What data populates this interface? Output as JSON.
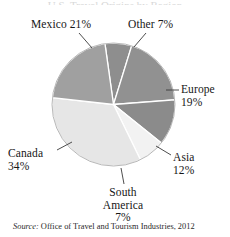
{
  "figure": {
    "title_remnant": "U.S. Travel Origins by Region",
    "source_prefix": "Source:",
    "source_text": " Office of Travel and Tourism Industries, 2012"
  },
  "labels": {
    "mexico": {
      "name": "Mexico",
      "pct": "21%"
    },
    "other": {
      "name": "Other",
      "pct": "7%"
    },
    "europe": {
      "name": "Europe",
      "pct": "19%"
    },
    "asia": {
      "name": "Asia",
      "pct": "12%"
    },
    "canada": {
      "name": "Canada",
      "pct": "34%"
    },
    "south_america": {
      "name": "South",
      "name2": "America",
      "pct": "7%"
    }
  },
  "chart_data": {
    "type": "pie",
    "title": "",
    "categories": [
      "Other",
      "Europe",
      "Asia",
      "South America",
      "Canada",
      "Mexico"
    ],
    "values": [
      7,
      19,
      12,
      7,
      34,
      21
    ],
    "units": "percent",
    "total": 100,
    "start_angle_deg": -8,
    "direction": "clockwise",
    "legend": "none",
    "labels_position": "external-with-leader-lines",
    "colors": [
      "#8e8e8e",
      "#919191",
      "#8b8b8b",
      "#f2f2f2",
      "#e6e6e6",
      "#a0a0a0"
    ],
    "separator_color": "#ffffff",
    "slices": [
      {
        "label": "Other",
        "value": 7,
        "color": "#8e8e8e"
      },
      {
        "label": "Europe",
        "value": 19,
        "color": "#919191"
      },
      {
        "label": "Asia",
        "value": 12,
        "color": "#8b8b8b"
      },
      {
        "label": "South America",
        "value": 7,
        "color": "#f2f2f2"
      },
      {
        "label": "Canada",
        "value": 34,
        "color": "#e6e6e6"
      },
      {
        "label": "Mexico",
        "value": 21,
        "color": "#a0a0a0"
      }
    ],
    "source": "Office of Travel and Tourism Industries, 2012"
  }
}
